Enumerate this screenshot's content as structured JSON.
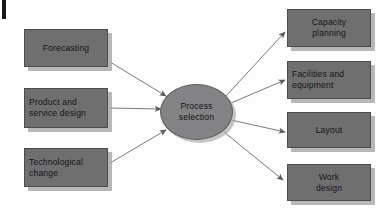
{
  "diagram": {
    "title": "Process selection",
    "background_color": "#fdfdfd",
    "node_fill_color": "#6f6f70",
    "node_border_color": "#4c4c4d",
    "hub_fill_color": "#838385",
    "shadow_color": "#a0a0a2",
    "text_color": "#15151a",
    "arrow_color": "#6b6b6d",
    "edge_mark": "",
    "hub": {
      "label": "Process\nselection",
      "x": 160,
      "y": 84,
      "width": 73,
      "height": 56
    },
    "inputs": [
      {
        "id": "forecasting",
        "label": "Forecasting",
        "x": 24,
        "y": 29,
        "width": 84,
        "height": 38,
        "align": "center"
      },
      {
        "id": "product-and-service-design",
        "label": "Product and\nservice design",
        "x": 24,
        "y": 88,
        "width": 84,
        "height": 40,
        "align": "left"
      },
      {
        "id": "technological-change",
        "label": "Technological\nchange",
        "x": 24,
        "y": 148,
        "width": 84,
        "height": 39,
        "align": "left"
      }
    ],
    "outputs": [
      {
        "id": "capacity-planning",
        "label": "Capacity\nplanning",
        "x": 287,
        "y": 9,
        "width": 84,
        "height": 38,
        "align": "center"
      },
      {
        "id": "facilities-and-equipment",
        "label": "Facilities and\nequipment",
        "x": 287,
        "y": 61,
        "width": 84,
        "height": 38,
        "align": "left"
      },
      {
        "id": "layout",
        "label": "Layout",
        "x": 287,
        "y": 112,
        "width": 84,
        "height": 36,
        "align": "center"
      },
      {
        "id": "work-design",
        "label": "Work\ndesign",
        "x": 287,
        "y": 164,
        "width": 84,
        "height": 37,
        "align": "center"
      }
    ],
    "connectors": [
      {
        "id": "forecasting-to-hub",
        "from": "forecasting",
        "to": "hub",
        "direction": "in"
      },
      {
        "id": "product-design-to-hub",
        "from": "product-and-service-design",
        "to": "hub",
        "direction": "in"
      },
      {
        "id": "technological-change-to-hub",
        "from": "technological-change",
        "to": "hub",
        "direction": "in"
      },
      {
        "id": "hub-to-capacity-planning",
        "from": "hub",
        "to": "capacity-planning",
        "direction": "out"
      },
      {
        "id": "hub-to-facilities",
        "from": "hub",
        "to": "facilities-and-equipment",
        "direction": "out"
      },
      {
        "id": "hub-to-layout",
        "from": "hub",
        "to": "layout",
        "direction": "out"
      },
      {
        "id": "hub-to-work-design",
        "from": "hub",
        "to": "work-design",
        "direction": "out"
      }
    ]
  }
}
